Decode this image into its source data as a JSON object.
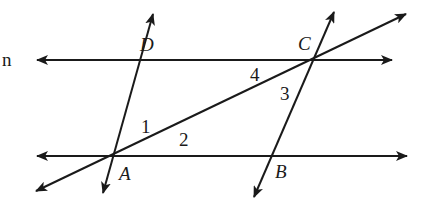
{
  "diagram": {
    "type": "geometry-parallelogram-transversal",
    "clipped_label": "n",
    "points": [
      {
        "name": "A",
        "x": 117,
        "y": 156
      },
      {
        "name": "B",
        "x": 273,
        "y": 156
      },
      {
        "name": "C",
        "x": 313,
        "y": 60
      },
      {
        "name": "D",
        "x": 153,
        "y": 60
      }
    ],
    "point_labels": {
      "A": {
        "text": "A",
        "x": 119,
        "y": 180
      },
      "B": {
        "text": "B",
        "x": 275,
        "y": 178
      },
      "C": {
        "text": "C",
        "x": 298,
        "y": 50
      },
      "D": {
        "text": "D",
        "x": 140,
        "y": 51
      }
    },
    "angle_labels": [
      {
        "text": "1",
        "x": 141,
        "y": 133
      },
      {
        "text": "2",
        "x": 179,
        "y": 146
      },
      {
        "text": "3",
        "x": 280,
        "y": 100
      },
      {
        "text": "4",
        "x": 250,
        "y": 81
      }
    ],
    "lines": [
      {
        "name": "line-DC",
        "from": [
          37,
          60
        ],
        "to": [
          392,
          60
        ],
        "arrows": "both"
      },
      {
        "name": "line-AB",
        "from": [
          37,
          156
        ],
        "to": [
          407,
          156
        ],
        "arrows": "both"
      },
      {
        "name": "line-AD",
        "from": [
          103,
          193
        ],
        "to": [
          153,
          14
        ],
        "arrows": "both"
      },
      {
        "name": "line-BC",
        "from": [
          254,
          197
        ],
        "to": [
          334,
          12
        ],
        "arrows": "both"
      },
      {
        "name": "line-AC",
        "from": [
          36,
          191
        ],
        "to": [
          406,
          14
        ],
        "arrows": "both"
      }
    ],
    "stroke_color": "#1a1a1a",
    "background": "#ffffff"
  }
}
